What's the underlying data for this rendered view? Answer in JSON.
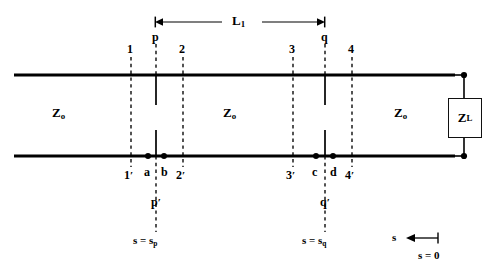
{
  "figure": {
    "type": "transmission-line-double-stub-tuner-diagram",
    "background_color": "#ffffff",
    "line_color": "#000000"
  },
  "dimension": {
    "label": "L",
    "label_subscript": "1",
    "arrow_left_x": 155,
    "arrow_right_x": 325,
    "arrow_y": 22
  },
  "reference_planes": [
    {
      "name": "plane-1",
      "top_label": "1",
      "bottom_label": "1",
      "bottom_prime": "′",
      "x": 131
    },
    {
      "name": "plane-p",
      "top_label": "p",
      "bottom_label": "p",
      "bottom_prime": "′",
      "x": 156
    },
    {
      "name": "plane-2",
      "top_label": "2",
      "bottom_label": "2",
      "bottom_prime": "′",
      "x": 183
    },
    {
      "name": "plane-3",
      "top_label": "3",
      "bottom_label": "3",
      "bottom_prime": "′",
      "x": 293
    },
    {
      "name": "plane-q",
      "top_label": "q",
      "bottom_label": "q",
      "bottom_prime": "′",
      "x": 325
    },
    {
      "name": "plane-4",
      "top_label": "4",
      "bottom_label": "4",
      "bottom_prime": "′",
      "x": 352
    }
  ],
  "terminal_dots": [
    {
      "label": "a",
      "x": 148
    },
    {
      "label": "b",
      "x": 164
    },
    {
      "label": "c",
      "x": 316
    },
    {
      "label": "d",
      "x": 333
    }
  ],
  "impedances": {
    "section_left": {
      "symbol": "Z",
      "subscript": "o",
      "x": 60,
      "y": 113
    },
    "section_middle": {
      "symbol": "Z",
      "subscript": "o",
      "x": 230,
      "y": 113
    },
    "section_right": {
      "symbol": "Z",
      "subscript": "o",
      "x": 400,
      "y": 113
    },
    "load": {
      "symbol": "Z",
      "subscript": "L"
    }
  },
  "position_markers": [
    {
      "name": "s-equals-sp",
      "text": "s = s",
      "subscript": "p",
      "x": 156,
      "y": 240
    },
    {
      "name": "s-equals-sq",
      "text": "s = s",
      "subscript": "q",
      "x": 325,
      "y": 240
    },
    {
      "name": "s-equals-zero",
      "text": "s = 0",
      "subscript": "",
      "x": 437,
      "y": 255
    }
  ],
  "s_axis": {
    "label": "s",
    "label_x": 395,
    "label_y": 238,
    "arrow_from_x": 438,
    "arrow_to_x": 408,
    "arrow_y": 238
  },
  "geometry": {
    "top_conductor_y": 75,
    "bottom_conductor_y": 156,
    "conductor_left_x": 14,
    "conductor_right_x": 455,
    "load_box": {
      "x": 448,
      "y": 98,
      "width": 32,
      "height": 38
    },
    "dashed_top_y": 57,
    "dashed_bottom_y": 172,
    "stub_top_len": 28,
    "stub_bottom_len": 26
  }
}
